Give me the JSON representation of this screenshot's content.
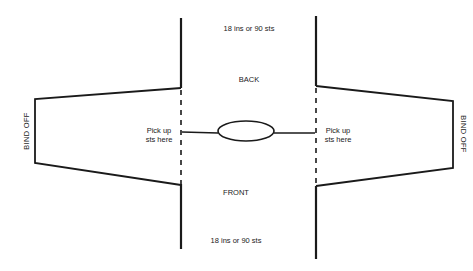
{
  "diagram": {
    "type": "knitting-schematic",
    "colors": {
      "line": "#1a1a1a",
      "background": "#ffffff"
    },
    "labels": {
      "top_width": "18 ins or 90 sts",
      "bottom_width": "18 ins or 90 sts",
      "back": "BACK",
      "front": "FRONT",
      "pick_up_left_line1": "Pick up",
      "pick_up_left_line2": "sts here",
      "pick_up_right_line1": "Pick up",
      "pick_up_right_line2": "sts here",
      "bind_off_left": "BIND OFF",
      "bind_off_right": "BIND OFF"
    },
    "parts": [
      {
        "name": "body",
        "description": "Central rectangle (back over front)"
      },
      {
        "name": "left-sleeve",
        "description": "Tapered sleeve picked up along left side"
      },
      {
        "name": "right-sleeve",
        "description": "Tapered sleeve picked up along right side"
      },
      {
        "name": "neck-opening",
        "description": "Oval neck opening on shoulder line"
      }
    ]
  }
}
